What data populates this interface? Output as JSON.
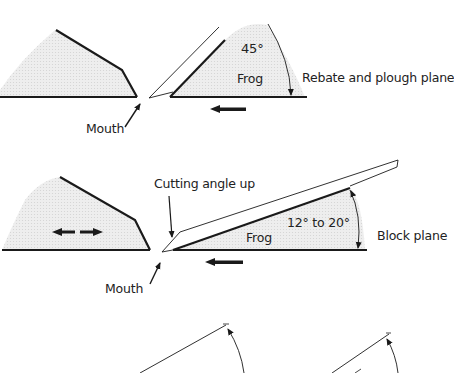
{
  "diagram": {
    "top": {
      "title": "Rebate and plough plane",
      "angle_label": "45°",
      "frog_label": "Frog",
      "mouth_label": "Mouth"
    },
    "middle": {
      "title": "Block plane",
      "angle_label": "12° to 20°",
      "frog_label": "Frog",
      "mouth_label": "Mouth",
      "cutting_label": "Cutting angle up"
    }
  },
  "colors": {
    "line": "#1a1a1a",
    "fill": "#ececec",
    "background": "#ffffff"
  }
}
